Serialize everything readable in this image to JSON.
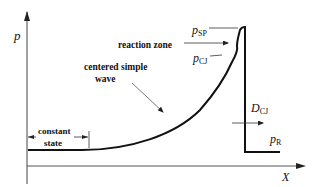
{
  "diagram": {
    "axes": {
      "y_label": "p",
      "x_label": "X"
    },
    "labels": {
      "p_sp": {
        "main": "p",
        "sub": "SP"
      },
      "p_cj": {
        "main": "p",
        "sub": "CJ"
      },
      "p_r": {
        "main": "p",
        "sub": "R"
      },
      "d_cj": {
        "main": "D",
        "sub": "CJ"
      },
      "reaction_zone": "reaction zone",
      "centered_simple_wave_line1": "centered simple",
      "centered_simple_wave_line2": "wave",
      "constant_state_line1": "constant",
      "constant_state_line2": "state"
    },
    "colors": {
      "stroke": "#111111",
      "arrow": "#333333",
      "axis": "#333333"
    }
  }
}
